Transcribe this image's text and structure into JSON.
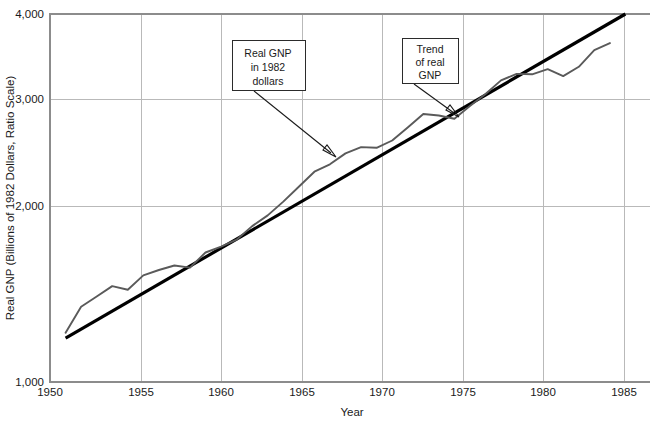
{
  "chart_data": {
    "type": "line",
    "title": "",
    "xlabel": "Year",
    "ylabel": "Real GNP (Billions of 1982 Dollars, Ratio Scale)",
    "scale": "log",
    "grid": true,
    "legend_position": "none",
    "xlim": [
      1949,
      1987
    ],
    "ylim": [
      1000,
      4000
    ],
    "xticks": [
      1950,
      1955,
      1960,
      1965,
      1970,
      1975,
      1980,
      1985
    ],
    "xtick_labels": [
      "1950",
      "1955",
      "1960",
      "1965",
      "1970",
      "1975",
      "1980",
      "1985"
    ],
    "yticks": [
      1000,
      2000,
      3000,
      4000
    ],
    "ytick_labels": [
      "1,000",
      "2,000",
      "3,000",
      "4,000"
    ],
    "series": [
      {
        "name": "Real GNP in 1982 dollars",
        "color": "#5a5a5a",
        "x": [
          1950,
          1951,
          1952,
          1953,
          1954,
          1955,
          1956,
          1957,
          1958,
          1959,
          1960,
          1961,
          1962,
          1963,
          1964,
          1965,
          1966,
          1967,
          1968,
          1969,
          1970,
          1971,
          1972,
          1973,
          1974,
          1975,
          1976,
          1977,
          1978,
          1979,
          1980,
          1981,
          1982,
          1983,
          1984,
          1985
        ],
        "values": [
          1204,
          1328,
          1380,
          1435,
          1416,
          1494,
          1525,
          1551,
          1539,
          1629,
          1665,
          1709,
          1799,
          1873,
          1973,
          2087,
          2208,
          2271,
          2366,
          2423,
          2416,
          2484,
          2608,
          2744,
          2729,
          2695,
          2827,
          2959,
          3115,
          3192,
          3187,
          3249,
          3166,
          3279,
          3490,
          3585
        ]
      },
      {
        "name": "Trend of real GNP",
        "color": "#000000",
        "x": [
          1950,
          1986
        ],
        "values": [
          1180,
          4000
        ]
      }
    ],
    "annotations": [
      {
        "id": "annotation-real-gnp",
        "lines": [
          "Real GNP",
          "in 1982",
          "dollars"
        ],
        "box": {
          "x": 232,
          "y": 40,
          "width": 73,
          "height": 50
        },
        "arrow": {
          "x1": 254,
          "y1": 91,
          "x2": 334,
          "y2": 156
        }
      },
      {
        "id": "annotation-trend",
        "lines": [
          "Trend",
          "of real",
          "GNP"
        ],
        "box": {
          "x": 402,
          "y": 38,
          "width": 56,
          "height": 45
        },
        "arrow": {
          "x1": 414,
          "y1": 84,
          "x2": 457,
          "y2": 116
        }
      }
    ]
  }
}
